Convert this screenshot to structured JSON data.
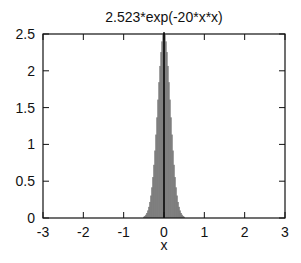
{
  "chart_data": {
    "type": "bar",
    "style": "impulses",
    "title": "2.523*exp(-20*x*x)",
    "xlabel": "x",
    "ylabel": "",
    "xlim": [
      -3,
      3
    ],
    "ylim": [
      0,
      2.5
    ],
    "xticks": [
      -3,
      -2,
      -1,
      0,
      1,
      2,
      3
    ],
    "xtick_labels": [
      "-3",
      "-2",
      "-1",
      "0",
      "1",
      "2",
      "3"
    ],
    "yticks": [
      0,
      0.5,
      1,
      1.5,
      2,
      2.5
    ],
    "ytick_labels": [
      "0",
      "0.5",
      "1",
      "1.5",
      "2",
      "2.5"
    ],
    "grid": false,
    "legend": null,
    "function": {
      "amplitude": 2.523,
      "coefficient": -20
    },
    "x": [
      -0.5,
      -0.45,
      -0.4,
      -0.35,
      -0.3,
      -0.25,
      -0.2,
      -0.15,
      -0.1,
      -0.05,
      0,
      0.05,
      0.1,
      0.15,
      0.2,
      0.25,
      0.3,
      0.35,
      0.4,
      0.45,
      0.5
    ],
    "values": [
      0.017,
      0.044,
      0.103,
      0.218,
      0.417,
      0.722,
      1.133,
      1.608,
      2.066,
      2.4,
      2.523,
      2.4,
      2.066,
      1.608,
      1.133,
      0.722,
      0.417,
      0.218,
      0.103,
      0.044,
      0.017
    ],
    "colors": {
      "bars": "#555555",
      "axes": "#111111",
      "background": "#ffffff"
    }
  }
}
